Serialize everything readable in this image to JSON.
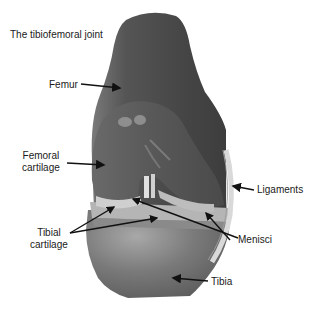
{
  "title": "The tibiofemoral joint",
  "labels": {
    "femur": "Femur",
    "femoral_cartilage_1": "Femoral",
    "femoral_cartilage_2": "cartilage",
    "tibial_cartilage_1": "Tibial",
    "tibial_cartilage_2": "cartilage",
    "ligaments": "Ligaments",
    "menisci": "Menisci",
    "tibia": "Tibia"
  },
  "colors": {
    "bone_dark": "#4a4a4a",
    "bone_mid": "#6e6e6e",
    "cartilage": "#5c5c5c",
    "meniscus": "#c8c8c8",
    "tibia": "#707070",
    "ligament": "#d9d9d9",
    "arrow": "#111111"
  }
}
